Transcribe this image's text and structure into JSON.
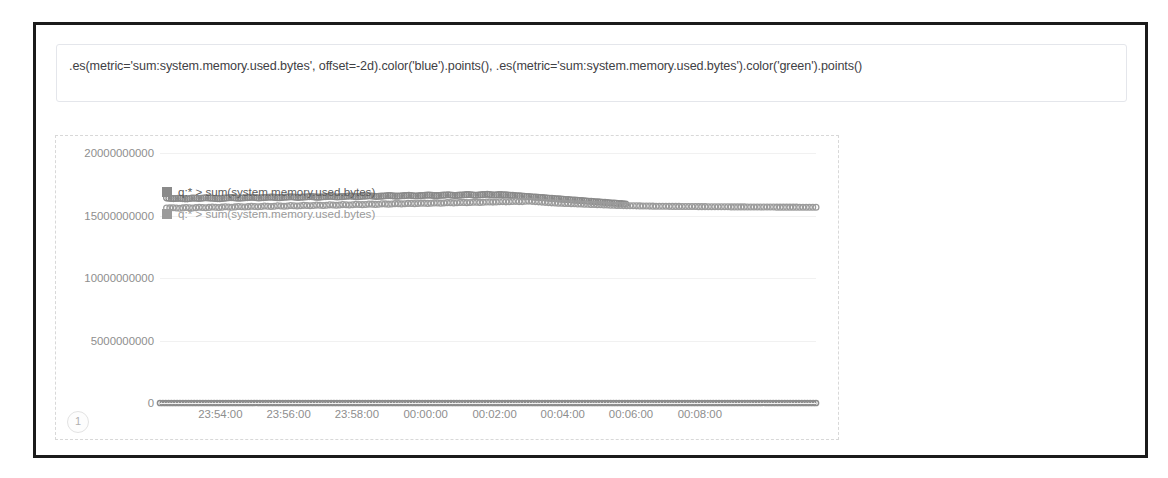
{
  "expression": {
    "value": ".es(metric='sum:system.memory.used.bytes', offset=-2d).color('blue').points(), .es(metric='sum:system.memory.used.bytes').color('green').points()",
    "placeholder": "Enter a timelion expression"
  },
  "chart_badge": "1",
  "legend": [
    {
      "label": "q:* > sum(system.memory.used.bytes)",
      "color": "#8a8a8a"
    },
    {
      "label": "q:* > sum(system.memory.used.bytes)",
      "color": "#9b9b9b"
    }
  ],
  "colors": {
    "series_offset": "#8a8a8a",
    "series_current": "#9b9b9b",
    "zero_series": "#8c8c8c",
    "grid": "#f1f1f1",
    "axis_text": "#8e8e8e",
    "panel_border": "#d8d8d8",
    "frame": "#1b1b1b"
  },
  "chart_data": {
    "type": "scatter",
    "title": "",
    "xlabel": "",
    "ylabel": "",
    "grid": true,
    "legend_position": "top-left",
    "ylim": [
      0,
      20000000000
    ],
    "yticks": [
      20000000000,
      15000000000,
      10000000000,
      5000000000,
      0
    ],
    "ytick_labels": [
      "20000000000",
      "15000000000",
      "10000000000",
      "5000000000",
      "0"
    ],
    "xtick_labels": [
      "23:54:00",
      "23:56:00",
      "23:58:00",
      "00:00:00",
      "00:02:00",
      "00:04:00",
      "00:06:00",
      "00:08:00"
    ],
    "xticks_positions_pct": [
      9.2,
      19.6,
      30.0,
      40.5,
      51.0,
      61.4,
      71.8,
      82.3
    ],
    "series": [
      {
        "name": "q:* > sum(system.memory.used.bytes) offset=-2d",
        "color": "#8a8a8a",
        "marker": "circle-open",
        "x_pct": [
          1.0,
          2.0,
          3.0,
          4.0,
          5.0,
          6.0,
          7.0,
          8.0,
          9.0,
          10.0,
          11.0,
          12.0,
          13.0,
          14.0,
          15.0,
          16.0,
          17.0,
          18.0,
          19.0,
          20.0,
          21.0,
          22.0,
          23.0,
          24.0,
          25.0,
          26.0,
          27.0,
          28.0,
          29.0,
          30.0,
          31.0,
          32.0,
          33.0,
          34.0,
          35.0,
          36.0,
          37.0,
          38.0,
          39.0,
          40.0,
          41.0,
          42.0,
          43.0,
          44.0,
          45.0,
          46.0,
          47.0,
          48.0,
          49.0,
          50.0,
          51.0,
          52.0,
          53.0,
          54.0,
          55.0,
          56.0,
          57.0,
          58.0,
          59.0,
          60.0,
          61.0,
          62.0,
          63.0,
          64.0,
          65.0,
          66.0,
          67.0,
          68.0,
          69.0,
          70.0,
          71.0
        ],
        "values": [
          16400000000,
          16350000000,
          16380000000,
          16320000000,
          16400000000,
          16360000000,
          16420000000,
          16380000000,
          16340000000,
          16400000000,
          16440000000,
          16380000000,
          16420000000,
          16460000000,
          16400000000,
          16440000000,
          16480000000,
          16420000000,
          16460000000,
          16500000000,
          16440000000,
          16480000000,
          16520000000,
          16460000000,
          16500000000,
          16540000000,
          16480000000,
          16520000000,
          16560000000,
          16500000000,
          16540000000,
          16580000000,
          16520000000,
          16560000000,
          16600000000,
          16540000000,
          16580000000,
          16620000000,
          16560000000,
          16600000000,
          16640000000,
          16580000000,
          16620000000,
          16660000000,
          16600000000,
          16640000000,
          16680000000,
          16620000000,
          16660000000,
          16700000000,
          16640000000,
          16680000000,
          16640000000,
          16600000000,
          16560000000,
          16520000000,
          16480000000,
          16440000000,
          16400000000,
          16360000000,
          16320000000,
          16280000000,
          16240000000,
          16200000000,
          16160000000,
          16120000000,
          16080000000,
          16040000000,
          16000000000,
          15960000000,
          15920000000
        ]
      },
      {
        "name": "q:* > sum(system.memory.used.bytes)",
        "color": "#9b9b9b",
        "marker": "circle-open",
        "x_pct": [
          1.0,
          2.0,
          3.0,
          4.0,
          5.0,
          6.0,
          7.0,
          8.0,
          9.0,
          10.0,
          11.0,
          12.0,
          13.0,
          14.0,
          15.0,
          16.0,
          17.0,
          18.0,
          19.0,
          20.0,
          21.0,
          22.0,
          23.0,
          24.0,
          25.0,
          26.0,
          27.0,
          28.0,
          29.0,
          30.0,
          31.0,
          32.0,
          33.0,
          34.0,
          35.0,
          36.0,
          37.0,
          38.0,
          39.0,
          40.0,
          41.0,
          42.0,
          43.0,
          44.0,
          45.0,
          46.0,
          47.0,
          48.0,
          49.0,
          50.0,
          51.0,
          52.0,
          53.0,
          54.0,
          55.0,
          56.0,
          57.0,
          58.0,
          59.0,
          60.0,
          61.0,
          62.0,
          63.0,
          64.0,
          65.0,
          66.0,
          67.0,
          68.0,
          69.0,
          70.0,
          71.0,
          72.0,
          73.0,
          74.0,
          75.0,
          76.0,
          77.0,
          78.0,
          79.0,
          80.0,
          81.0,
          82.0,
          83.0,
          84.0,
          85.0,
          86.0,
          87.0,
          88.0,
          89.0,
          90.0,
          91.0,
          92.0,
          93.0,
          94.0,
          95.0,
          96.0,
          97.0,
          98.0,
          99.0,
          100.0
        ],
        "values": [
          15600000000,
          15620000000,
          15580000000,
          15640000000,
          15600000000,
          15660000000,
          15620000000,
          15680000000,
          15640000000,
          15700000000,
          15660000000,
          15720000000,
          15680000000,
          15740000000,
          15700000000,
          15760000000,
          15720000000,
          15780000000,
          15740000000,
          15800000000,
          15760000000,
          15820000000,
          15780000000,
          15840000000,
          15800000000,
          15860000000,
          15820000000,
          15880000000,
          15840000000,
          15900000000,
          15860000000,
          15920000000,
          15880000000,
          15940000000,
          15900000000,
          15960000000,
          15920000000,
          15980000000,
          15940000000,
          16000000000,
          15960000000,
          16020000000,
          15980000000,
          16040000000,
          16000000000,
          16060000000,
          16020000000,
          16080000000,
          16040000000,
          16100000000,
          16060000000,
          16120000000,
          16080000000,
          16140000000,
          16100000000,
          16160000000,
          16120000000,
          16080000000,
          16040000000,
          16000000000,
          15980000000,
          15960000000,
          15940000000,
          15920000000,
          15900000000,
          15880000000,
          15860000000,
          15840000000,
          15820000000,
          15800000000,
          15790000000,
          15780000000,
          15770000000,
          15760000000,
          15750000000,
          15740000000,
          15740000000,
          15730000000,
          15730000000,
          15720000000,
          15720000000,
          15710000000,
          15710000000,
          15700000000,
          15700000000,
          15700000000,
          15690000000,
          15690000000,
          15690000000,
          15680000000,
          15680000000,
          15680000000,
          15680000000,
          15670000000,
          15670000000,
          15670000000,
          15670000000,
          15660000000,
          15660000000,
          15660000000
        ]
      },
      {
        "name": "zero-baseline",
        "color": "#8c8c8c",
        "marker": "circle-open",
        "x_pct": [
          0.0,
          100.0
        ],
        "values": [
          0,
          0
        ],
        "note": "dense flat series at y=0 spanning full width"
      }
    ]
  }
}
